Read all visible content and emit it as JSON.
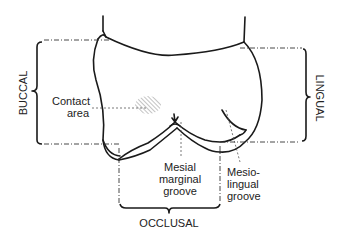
{
  "figure": {
    "type": "dental-anatomy-diagram"
  },
  "brackets": {
    "buccal": {
      "label": "BUCCAL",
      "orientation": "vertical-rotated-ccw"
    },
    "lingual": {
      "label": "LINGUAL",
      "orientation": "vertical-rotated-cw"
    },
    "occlusal": {
      "label": "OCCLUSAL",
      "orientation": "horizontal"
    }
  },
  "callouts": {
    "contact_area": {
      "line1": "Contact",
      "line2": "area"
    },
    "mesial_marginal_groove": {
      "line1": "Mesial",
      "line2": "marginal",
      "line3": "groove"
    },
    "mesio_lingual_groove": {
      "line1": "Mesio-",
      "line2": "lingual",
      "line3": "groove"
    }
  },
  "colors": {
    "line": "#1a1a1a",
    "text": "#222222",
    "hatch": "#888888",
    "background": "#ffffff"
  }
}
